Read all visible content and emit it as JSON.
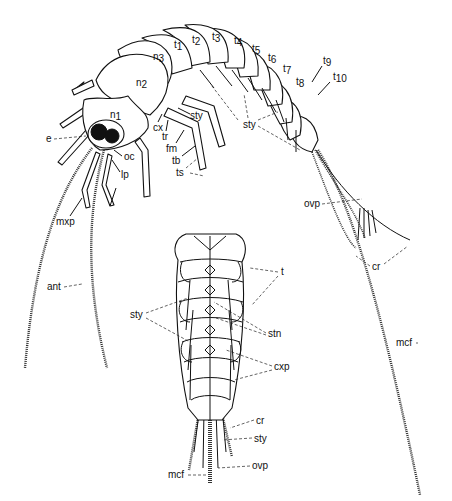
{
  "figure": {
    "lateral_view": {
      "thoracic_labels": {
        "n1": {
          "base": "n",
          "sub": "1"
        },
        "n2": {
          "base": "n",
          "sub": "2"
        },
        "n3": {
          "base": "n",
          "sub": "3"
        }
      },
      "tergite_labels": [
        {
          "base": "t",
          "sub": "1"
        },
        {
          "base": "t",
          "sub": "2"
        },
        {
          "base": "t",
          "sub": "3"
        },
        {
          "base": "t",
          "sub": "4"
        },
        {
          "base": "t",
          "sub": "5"
        },
        {
          "base": "t",
          "sub": "6"
        },
        {
          "base": "t",
          "sub": "7"
        },
        {
          "base": "t",
          "sub": "8"
        },
        {
          "base": "t",
          "sub": "9"
        },
        {
          "base": "t",
          "sub": "10"
        }
      ],
      "labels": {
        "e": "e",
        "oc": "oc",
        "lp": "lp",
        "mxp": "mxp",
        "ant": "ant",
        "cx": "cx",
        "tr": "tr",
        "fm": "fm",
        "tb": "tb",
        "ts": "ts",
        "sty_leg": "sty",
        "sty_abdomen": "sty",
        "ovp": "ovp",
        "cr": "cr",
        "mcf": "mcf"
      }
    },
    "ventral_view": {
      "labels": {
        "t": "t",
        "sty": "sty",
        "stn": "stn",
        "cxp": "cxp",
        "cr": "cr",
        "sty_bottom": "sty",
        "ovp": "ovp",
        "mcf": "mcf"
      }
    }
  }
}
